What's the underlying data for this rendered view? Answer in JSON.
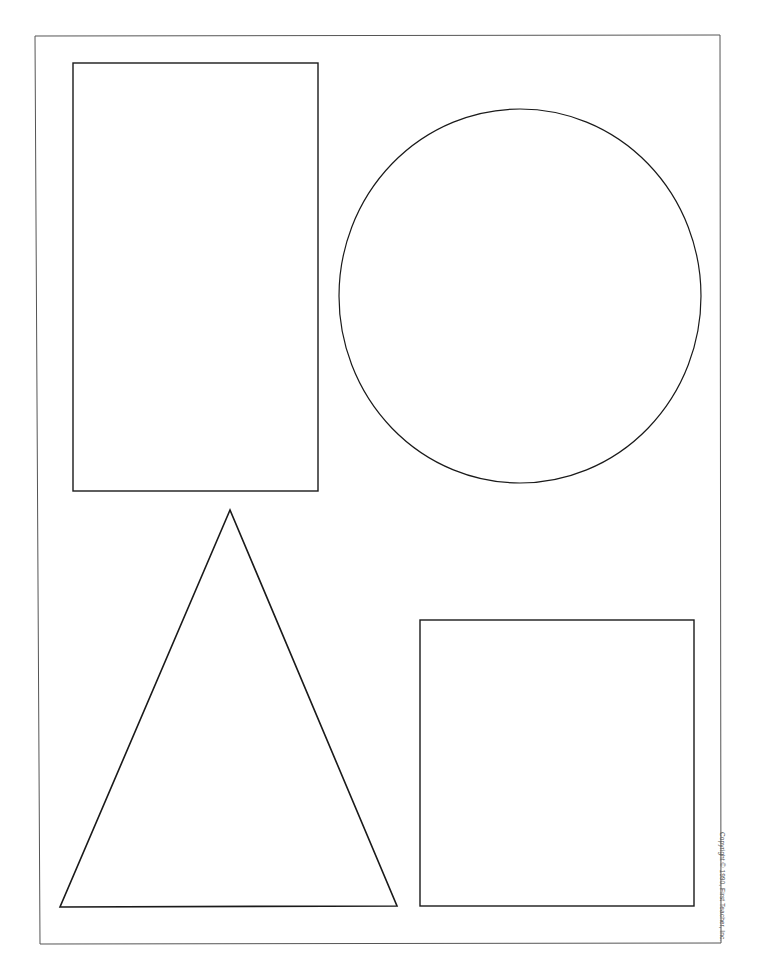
{
  "worksheet": {
    "copyright": "Copyright © 1990, First Teacher, Inc.",
    "stroke_color": "#1a1a1a",
    "border_color": "#444444",
    "background": "#ffffff",
    "shapes": [
      {
        "name": "rectangle",
        "type": "rect",
        "x": 73,
        "y": 63,
        "width": 245,
        "height": 428
      },
      {
        "name": "circle",
        "type": "ellipse",
        "cx": 520,
        "cy": 296,
        "rx": 181,
        "ry": 187
      },
      {
        "name": "triangle",
        "type": "polygon",
        "points": [
          [
            230,
            510
          ],
          [
            60,
            907
          ],
          [
            397,
            906
          ]
        ]
      },
      {
        "name": "square",
        "type": "rect",
        "x": 420,
        "y": 620,
        "width": 274,
        "height": 286
      }
    ]
  }
}
